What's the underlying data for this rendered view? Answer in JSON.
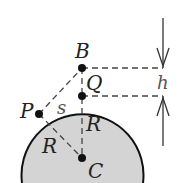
{
  "diagram": {
    "labels": {
      "B": "B",
      "Q": "Q",
      "P": "P",
      "C": "C",
      "s": "s",
      "R1": "R",
      "R2": "R",
      "h": "h"
    },
    "colors": {
      "disk_fill": "#d4d4d4",
      "stroke": "#111111",
      "dash": "#444444"
    }
  }
}
